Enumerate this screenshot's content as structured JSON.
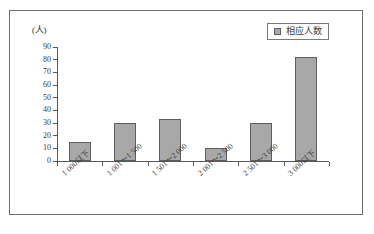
{
  "chart_data": {
    "type": "bar",
    "title": "",
    "xlabel": "",
    "ylabel": "(人)",
    "ylim": [
      0,
      90
    ],
    "grid": false,
    "legend_position": "top-right",
    "categories": [
      "1 000以下",
      "1 001～1 500",
      "1 501～2 000",
      "2 001～2 500",
      "2 501～3 000",
      "3 000以下"
    ],
    "values": [
      15,
      30,
      33,
      10,
      30,
      82
    ],
    "series": [
      {
        "name": "相应人数",
        "values": [
          15,
          30,
          33,
          10,
          30,
          82
        ],
        "color": "#a8a8a8"
      }
    ],
    "y_ticks": [
      90,
      80,
      70,
      60,
      50,
      40,
      30,
      20,
      10,
      0
    ],
    "legend": [
      "相应人数"
    ]
  },
  "axis": {
    "y_unit_label": "(人)"
  },
  "legend": {
    "label": "相应人数"
  },
  "colors": {
    "bar_fill": "#a8a8a8",
    "bar_stroke": "#5e5e5e",
    "axis": "#595959",
    "frame": "#6e6e6e",
    "text": "#3a3a3a"
  }
}
